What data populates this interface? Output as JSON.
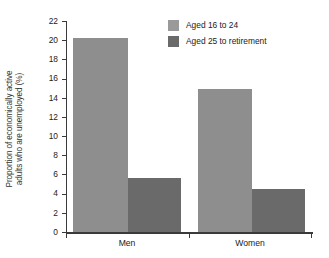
{
  "chart_data": {
    "type": "bar",
    "title": "",
    "subtitle": "",
    "xlabel": "",
    "ylabel_line1": "Proportion of economically active",
    "ylabel_line2": "adults who are unemployed (%)",
    "categories": [
      "Men",
      "Women"
    ],
    "series": [
      {
        "name": "Aged 16 to 24",
        "color": "#8e8e8e",
        "values": [
          20.2,
          14.9
        ]
      },
      {
        "name": "Aged 25 to retirement",
        "color": "#6a6a6a",
        "values": [
          5.6,
          4.5
        ]
      }
    ],
    "ylim": [
      0,
      22
    ],
    "ytick_step": 2,
    "yticks": [
      "22",
      "20",
      "18",
      "16",
      "14",
      "12",
      "10",
      "8",
      "6",
      "4",
      "2",
      "0"
    ],
    "grid": false,
    "legend_position": "top-right"
  },
  "legend": {
    "entries": [
      {
        "label": "Aged 16 to 24",
        "swatch": "light"
      },
      {
        "label": "Aged 25 to retirement",
        "swatch": "dark"
      }
    ]
  },
  "axis": {
    "x_categories": [
      "Men",
      "Women"
    ]
  },
  "colors": {
    "series_light": "#8e8e8e",
    "series_dark": "#6a6a6a",
    "axis": "#3a3a3a",
    "text": "#222222",
    "background": "#ffffff"
  }
}
